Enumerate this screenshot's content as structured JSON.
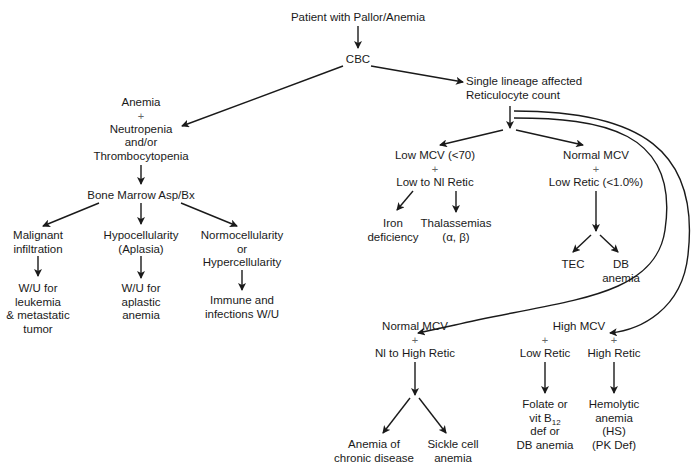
{
  "diagram": {
    "title": "Patient with Pallor/Anemia",
    "nodes": {
      "root": {
        "lines": [
          "Patient with Pallor/Anemia"
        ]
      },
      "cbc": {
        "lines": [
          "CBC"
        ]
      },
      "single_lineage": {
        "lines": [
          "Single lineage affected",
          "Reticulocyte count"
        ]
      },
      "multi_lineage": {
        "lines": [
          "Anemia",
          "+",
          "Neutropenia",
          "and/or",
          "Thrombocytopenia"
        ]
      },
      "bone_marrow": {
        "lines": [
          "Bone Marrow Asp/Bx"
        ]
      },
      "malignant": {
        "lines": [
          "Malignant",
          "infiltration"
        ]
      },
      "hypocellularity": {
        "lines": [
          "Hypocellularity",
          "(Aplasia)"
        ]
      },
      "normocellularity": {
        "lines": [
          "Normocellularity",
          "or",
          "Hypercellularity"
        ]
      },
      "wu_leukemia": {
        "lines": [
          "W/U for",
          "leukemia",
          "& metastatic",
          "tumor"
        ]
      },
      "wu_aplastic": {
        "lines": [
          "W/U for",
          "aplastic",
          "anemia"
        ]
      },
      "immune_wu": {
        "lines": [
          "Immune and",
          "infections W/U"
        ]
      },
      "low_mcv": {
        "lines": [
          "Low MCV (<70)",
          "+",
          "Low to Nl Retic"
        ]
      },
      "normal_mcv_low": {
        "lines": [
          "Normal MCV",
          "+",
          "Low Retic (<1.0%)"
        ]
      },
      "iron_def": {
        "lines": [
          "Iron",
          "deficiency"
        ]
      },
      "thalassemias": {
        "lines": [
          "Thalassemias",
          "(α,    β)"
        ]
      },
      "tec": {
        "lines": [
          "TEC"
        ]
      },
      "db_anemia": {
        "lines": [
          "DB",
          "anemia"
        ]
      },
      "normal_mcv_high": {
        "lines": [
          "Normal MCV",
          "+",
          "Nl to High Retic"
        ]
      },
      "high_mcv": {
        "lines": [
          "High MCV"
        ]
      },
      "low_retic": {
        "lines": [
          "+",
          "Low Retic"
        ]
      },
      "high_retic": {
        "lines": [
          "+",
          "High Retic"
        ]
      },
      "anemia_chronic": {
        "lines": [
          "Anemia of",
          "chronic disease"
        ]
      },
      "sickle_cell": {
        "lines": [
          "Sickle cell",
          "anemia"
        ]
      },
      "folate": {
        "lines": [
          "Folate or",
          "vit B",
          "12",
          "def or",
          "DB anemia"
        ]
      },
      "hemolytic": {
        "lines": [
          "Hemolytic",
          "anemia",
          "(HS)",
          "(PK Def)"
        ]
      }
    },
    "edges": [
      [
        "root",
        "cbc"
      ],
      [
        "cbc",
        "multi_lineage"
      ],
      [
        "cbc",
        "single_lineage"
      ],
      [
        "multi_lineage",
        "bone_marrow"
      ],
      [
        "bone_marrow",
        "malignant"
      ],
      [
        "bone_marrow",
        "hypocellularity"
      ],
      [
        "bone_marrow",
        "normocellularity"
      ],
      [
        "malignant",
        "wu_leukemia"
      ],
      [
        "hypocellularity",
        "wu_aplastic"
      ],
      [
        "normocellularity",
        "immune_wu"
      ],
      [
        "single_lineage",
        "low_mcv"
      ],
      [
        "single_lineage",
        "normal_mcv_low"
      ],
      [
        "single_lineage",
        "normal_mcv_high"
      ],
      [
        "single_lineage",
        "high_mcv"
      ],
      [
        "low_mcv",
        "iron_def"
      ],
      [
        "low_mcv",
        "thalassemias"
      ],
      [
        "normal_mcv_low",
        "tec"
      ],
      [
        "normal_mcv_low",
        "db_anemia"
      ],
      [
        "normal_mcv_high",
        "anemia_chronic"
      ],
      [
        "normal_mcv_high",
        "sickle_cell"
      ],
      [
        "low_retic",
        "folate"
      ],
      [
        "high_retic",
        "hemolytic"
      ]
    ],
    "colors": {
      "line": "#1a1a1a",
      "text": "#1a1a1a",
      "plus": "#666666",
      "background": "#ffffff"
    }
  }
}
